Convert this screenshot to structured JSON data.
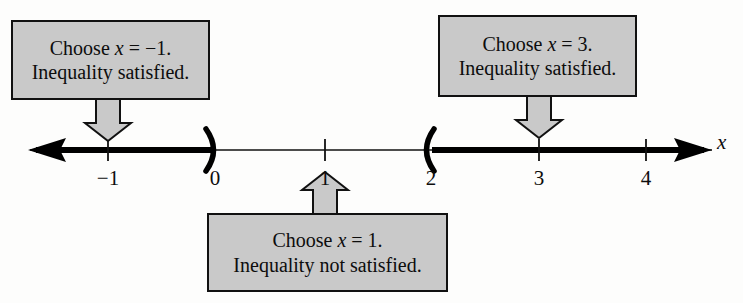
{
  "figure": {
    "type": "number-line-inequality-test-intervals",
    "axis_variable": "x",
    "axis": {
      "arrow_left_label": "left-arrow",
      "arrow_right_label": "right-arrow",
      "ticks": [
        {
          "value": -1,
          "label": "−1",
          "x": 108
        },
        {
          "value": 0,
          "label": "0",
          "x": 213
        },
        {
          "value": 1,
          "label": "1",
          "x": 325
        },
        {
          "value": 2,
          "label": "2",
          "x": 429
        },
        {
          "value": 3,
          "label": "3",
          "x": 539
        },
        {
          "value": 4,
          "label": "4",
          "x": 646
        }
      ],
      "endpoints": [
        {
          "at": 0,
          "symbol": ")",
          "kind": "open-right"
        },
        {
          "at": 2,
          "symbol": "(",
          "kind": "open-left"
        }
      ],
      "shaded_intervals": [
        {
          "from": "-infinity",
          "to": 0,
          "style": "thick"
        },
        {
          "from": 2,
          "to": "+infinity",
          "style": "thick"
        }
      ]
    },
    "callouts": [
      {
        "id": "callout-neg1",
        "line1": "Choose x = −1.",
        "line1_prefix": "Choose ",
        "line1_var": "x",
        "line1_suffix": " = −1.",
        "line2": "Inequality satisfied.",
        "points_to": -1,
        "arrow_direction": "down"
      },
      {
        "id": "callout-3",
        "line1": "Choose x = 3.",
        "line1_prefix": "Choose ",
        "line1_var": "x",
        "line1_suffix": " = 3.",
        "line2": "Inequality satisfied.",
        "points_to": 3,
        "arrow_direction": "down"
      },
      {
        "id": "callout-1",
        "line1": "Choose x = 1.",
        "line1_prefix": "Choose ",
        "line1_var": "x",
        "line1_suffix": " = 1.",
        "line2": "Inequality not satisfied.",
        "points_to": 1,
        "arrow_direction": "up"
      }
    ],
    "colors": {
      "box_fill": "#c9c9c9",
      "stroke": "#111111",
      "ink": "#0d0d0d",
      "background": "#fdfdfc"
    }
  }
}
